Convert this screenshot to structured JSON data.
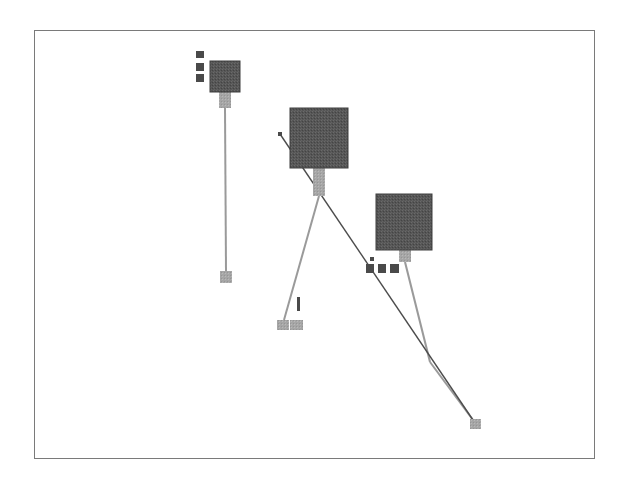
{
  "colors": {
    "frame": "#7a7a7a",
    "large_node": "#5a5a5a",
    "large_node_border": "#3f3f3f",
    "small_node_dark": "#4a4a4a",
    "connector": "#a0a0a0",
    "leaf_node": "#a8a8a8",
    "edge_light": "#9a9a9a",
    "edge_dark": "#4c4c4c"
  },
  "nodes": [
    {
      "id": "hub-a",
      "x": 210,
      "y": 61,
      "w": 30,
      "h": 31,
      "kind": "large"
    },
    {
      "id": "hub-b",
      "x": 290,
      "y": 108,
      "w": 58,
      "h": 60,
      "kind": "large"
    },
    {
      "id": "hub-c",
      "x": 376,
      "y": 194,
      "w": 56,
      "h": 56,
      "kind": "large"
    },
    {
      "id": "hub-a-port-1",
      "x": 196,
      "y": 51,
      "w": 8,
      "h": 7,
      "kind": "small"
    },
    {
      "id": "hub-a-port-2",
      "x": 196,
      "y": 63,
      "w": 8,
      "h": 8,
      "kind": "small"
    },
    {
      "id": "hub-a-port-3",
      "x": 196,
      "y": 74,
      "w": 8,
      "h": 8,
      "kind": "small"
    },
    {
      "id": "hub-c-port-1",
      "x": 366,
      "y": 264,
      "w": 8,
      "h": 9,
      "kind": "small"
    },
    {
      "id": "hub-c-port-2",
      "x": 378,
      "y": 264,
      "w": 8,
      "h": 9,
      "kind": "small"
    },
    {
      "id": "hub-c-port-3",
      "x": 390,
      "y": 264,
      "w": 9,
      "h": 9,
      "kind": "small"
    },
    {
      "id": "hub-c-port-tiny",
      "x": 370,
      "y": 257,
      "w": 4,
      "h": 4,
      "kind": "small"
    },
    {
      "id": "hub-b-pin",
      "x": 278,
      "y": 132,
      "w": 4,
      "h": 4,
      "kind": "small"
    },
    {
      "id": "leaf-a",
      "x": 220,
      "y": 271,
      "w": 12,
      "h": 12,
      "kind": "leaf"
    },
    {
      "id": "leaf-b-1",
      "x": 277,
      "y": 320,
      "w": 12,
      "h": 10,
      "kind": "leaf"
    },
    {
      "id": "leaf-b-2",
      "x": 290,
      "y": 320,
      "w": 13,
      "h": 10,
      "kind": "leaf"
    },
    {
      "id": "leaf-c",
      "x": 470,
      "y": 419,
      "w": 11,
      "h": 10,
      "kind": "leaf"
    },
    {
      "id": "marker",
      "x": 297,
      "y": 297,
      "w": 3,
      "h": 14,
      "kind": "small"
    }
  ],
  "connectors": [
    {
      "id": "hub-a-stem",
      "x": 219,
      "y": 92,
      "w": 12,
      "h": 16
    },
    {
      "id": "hub-b-stem",
      "x": 313,
      "y": 168,
      "w": 12,
      "h": 28
    },
    {
      "id": "hub-c-stem",
      "x": 399,
      "y": 250,
      "w": 12,
      "h": 12
    }
  ],
  "edges": [
    {
      "id": "edge-a",
      "x1": 225,
      "y1": 108,
      "x2": 226,
      "y2": 271,
      "style": "light"
    },
    {
      "id": "edge-b",
      "x1": 319,
      "y1": 196,
      "x2": 284,
      "y2": 320,
      "style": "light"
    },
    {
      "id": "edge-c",
      "x1": 405,
      "y1": 262,
      "x2": 430,
      "y2": 362,
      "style": "light"
    },
    {
      "id": "edge-c2",
      "x1": 430,
      "y1": 362,
      "x2": 473,
      "y2": 420,
      "style": "light"
    },
    {
      "id": "edge-long",
      "x1": 280,
      "y1": 134,
      "x2": 475,
      "y2": 423,
      "style": "dark"
    }
  ]
}
